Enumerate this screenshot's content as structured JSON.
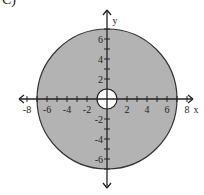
{
  "problem_label": "C)",
  "chart_data": {
    "type": "region",
    "title": "",
    "shapes": [
      {
        "kind": "circle",
        "cx": 0,
        "cy": 0,
        "r": 7,
        "fill": "#b3b3b3",
        "stroke": "#333333"
      },
      {
        "kind": "circle",
        "cx": 0,
        "cy": 0,
        "r": 1,
        "fill": "#ffffff",
        "stroke": "#222222"
      }
    ],
    "xlabel": "x",
    "ylabel": "y",
    "xlim": [
      -8,
      8
    ],
    "ylim": [
      -8,
      8
    ],
    "x_tick_labels": [
      "-8",
      "-6",
      "-4",
      "-2",
      "2",
      "4",
      "6",
      "8"
    ],
    "y_tick_labels": [
      "6",
      "4",
      "2",
      "-2",
      "-4",
      "-6"
    ],
    "grid": false
  },
  "colors": {
    "shade": "#b3b3b3",
    "stroke": "#333333",
    "axis": "#222222",
    "background": "#ffffff"
  }
}
